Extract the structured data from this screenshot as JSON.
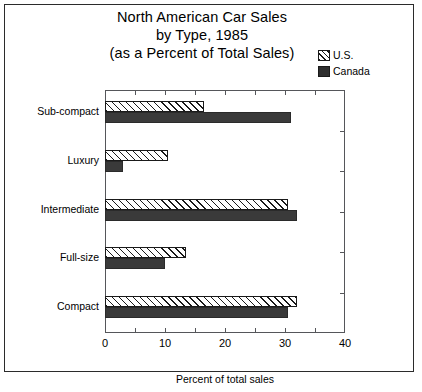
{
  "title": {
    "line1": "North American Car Sales",
    "line2": "by Type, 1985",
    "line3": "(as a Percent of Total Sales)"
  },
  "legend": {
    "items": [
      {
        "label": "U.S.",
        "swatch": "hatched-diagonal",
        "color": "#1a1a1a"
      },
      {
        "label": "Canada",
        "swatch": "solid-black",
        "color": "#2e2e2e"
      }
    ]
  },
  "axis": {
    "x_title": "Percent of total sales",
    "x_ticks": [
      "0",
      "10",
      "20",
      "30",
      "40"
    ],
    "x_min": 0,
    "x_max": 40
  },
  "bottom_caption": "",
  "chart_data": {
    "type": "bar",
    "orientation": "horizontal",
    "title": "North American Car Sales by Type, 1985 (as a Percent of Total Sales)",
    "xlabel": "Percent of total sales",
    "ylabel": "",
    "xlim": [
      0,
      40
    ],
    "grid": false,
    "legend_position": "top-right",
    "categories": [
      "Sub-compact",
      "Luxury",
      "Intermediate",
      "Full-size",
      "Compact"
    ],
    "series": [
      {
        "name": "U.S.",
        "values": [
          16.5,
          10.5,
          30.5,
          13.5,
          32.0
        ]
      },
      {
        "name": "Canada",
        "values": [
          31.0,
          3.0,
          32.0,
          10.0,
          30.5
        ]
      }
    ]
  }
}
